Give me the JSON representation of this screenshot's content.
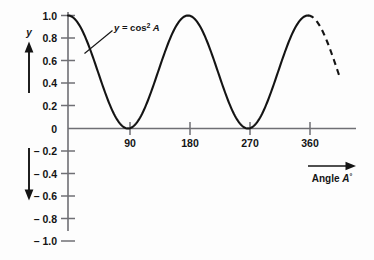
{
  "chart_data": {
    "type": "line",
    "title": "",
    "curve_label": "y = cos",
    "curve_label_exponent": "2",
    "curve_label_variable": "A",
    "xlabel": "Angle A°",
    "xlabel_text": "Angle ",
    "xlabel_variable": "A",
    "xlabel_degree": "°",
    "ylabel": "y",
    "function": "y = cos^2 A",
    "x": [
      0,
      10,
      20,
      30,
      40,
      50,
      60,
      70,
      80,
      90,
      100,
      110,
      120,
      130,
      140,
      150,
      160,
      170,
      180,
      190,
      200,
      210,
      220,
      230,
      240,
      250,
      260,
      270,
      280,
      290,
      300,
      310,
      320,
      330,
      340,
      350,
      360,
      370,
      380,
      390,
      400,
      410,
      420
    ],
    "y": [
      1.0,
      0.97,
      0.883,
      0.75,
      0.587,
      0.413,
      0.25,
      0.117,
      0.03,
      0.0,
      0.03,
      0.117,
      0.25,
      0.413,
      0.587,
      0.75,
      0.883,
      0.97,
      1.0,
      0.97,
      0.883,
      0.75,
      0.587,
      0.413,
      0.25,
      0.117,
      0.03,
      0.0,
      0.03,
      0.117,
      0.25,
      0.413,
      0.587,
      0.75,
      0.883,
      0.97,
      1.0,
      0.97,
      0.883,
      0.75,
      0.587,
      0.413,
      0.25
    ],
    "solid_until_x": 360,
    "dashed_from_x": 360,
    "dashed_until_x": 407,
    "xticks": [
      90,
      180,
      270,
      360
    ],
    "xtick_labels": [
      "90",
      "180",
      "270",
      "360"
    ],
    "yticks": [
      1.0,
      0.8,
      0.6,
      0.4,
      0.2,
      0,
      -0.2,
      -0.4,
      -0.6,
      -0.8,
      -1.0
    ],
    "ytick_labels": [
      "1.0",
      "0.8",
      "0.6",
      "0.4",
      "0.2",
      "0",
      "– 0.2",
      "– 0.4",
      "– 0.6",
      "– 0.8",
      "– 1.0"
    ],
    "xlim": [
      -14,
      422
    ],
    "ylim": [
      -1.12,
      1.08
    ],
    "grid": false,
    "legend": "none",
    "series_color": "#141414",
    "axis_color": "#6f6f74",
    "background_color": "#fdfdfd"
  },
  "annotations": {
    "y_axis_arrow_name": "y-direction-arrow-up",
    "y_negative_arrow_name": "y-direction-arrow-down",
    "x_axis_arrow_name": "x-direction-arrow-right",
    "leader_line_name": "curve-label-leader-line"
  }
}
